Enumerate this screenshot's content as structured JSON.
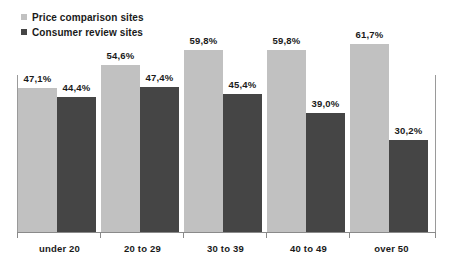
{
  "chart_data": {
    "type": "bar",
    "title": "",
    "subtitle": "",
    "xlabel": "",
    "ylabel": "",
    "ylim": [
      0,
      70
    ],
    "grid": false,
    "legend_position": "top-left",
    "decimal_separator": ",",
    "value_suffix": "%",
    "categories": [
      "under 20",
      "20 to 29",
      "30 to 39",
      "40 to 49",
      "over 50"
    ],
    "series": [
      {
        "name": "Price comparison sites",
        "color": "#c1c1c1",
        "values": [
          47.1,
          54.6,
          59.8,
          59.8,
          61.7
        ],
        "labels": [
          "47,1%",
          "54,6%",
          "59,8%",
          "59,8%",
          "61,7%"
        ]
      },
      {
        "name": "Consumer review sites",
        "color": "#454545",
        "values": [
          44.4,
          47.4,
          45.4,
          39.0,
          30.2
        ],
        "labels": [
          "44,4%",
          "47,4%",
          "45,4%",
          "39,0%",
          "30,2%"
        ]
      }
    ]
  },
  "legend": {
    "items": [
      {
        "label": "Price comparison sites",
        "color": "#c1c1c1"
      },
      {
        "label": "Consumer review sites",
        "color": "#454545"
      }
    ]
  },
  "axis": {
    "categories": [
      "under 20",
      "20 to 29",
      "30 to 39",
      "40 to 49",
      "over 50"
    ]
  }
}
